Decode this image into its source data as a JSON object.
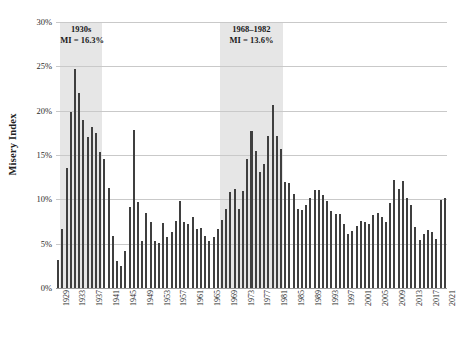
{
  "chart_data": {
    "type": "bar",
    "title": "",
    "xlabel": "",
    "ylabel": "Misery Index",
    "ylim": [
      0,
      30
    ],
    "grid": true,
    "legend": false,
    "y_ticks": [
      "0%",
      "5%",
      "10%",
      "15%",
      "20%",
      "25%",
      "30%"
    ],
    "y_tick_values": [
      0,
      5,
      10,
      15,
      20,
      25,
      30
    ],
    "x_tick_labels": [
      "1929",
      "1933",
      "1937",
      "1941",
      "1945",
      "1949",
      "1953",
      "1957",
      "1961",
      "1965",
      "1969",
      "1973",
      "1977",
      "1981",
      "1985",
      "1989",
      "1993",
      "1997",
      "2001",
      "2005",
      "2009",
      "2013",
      "2017",
      "2021"
    ],
    "categories": [
      1929,
      1930,
      1931,
      1932,
      1933,
      1934,
      1935,
      1936,
      1937,
      1938,
      1939,
      1940,
      1941,
      1942,
      1943,
      1944,
      1945,
      1946,
      1947,
      1948,
      1949,
      1950,
      1951,
      1952,
      1953,
      1954,
      1955,
      1956,
      1957,
      1958,
      1959,
      1960,
      1961,
      1962,
      1963,
      1964,
      1965,
      1966,
      1967,
      1968,
      1969,
      1970,
      1971,
      1972,
      1973,
      1974,
      1975,
      1976,
      1977,
      1978,
      1979,
      1980,
      1981,
      1982,
      1983,
      1984,
      1985,
      1986,
      1987,
      1988,
      1989,
      1990,
      1991,
      1992,
      1993,
      1994,
      1995,
      1996,
      1997,
      1998,
      1999,
      2000,
      2001,
      2002,
      2003,
      2004,
      2005,
      2006,
      2007,
      2008,
      2009,
      2010,
      2011,
      2012,
      2013,
      2014,
      2015,
      2016,
      2017,
      2018,
      2019,
      2020,
      2021
    ],
    "values": [
      3.2,
      6.7,
      13.5,
      19.9,
      24.7,
      22.0,
      19.0,
      17.0,
      18.2,
      17.5,
      15.3,
      14.5,
      11.3,
      5.9,
      3.0,
      2.5,
      4.2,
      9.1,
      17.8,
      9.7,
      5.3,
      8.5,
      7.4,
      5.3,
      5.1,
      7.3,
      5.8,
      6.3,
      7.6,
      9.8,
      7.5,
      7.2,
      8.0,
      6.7,
      6.8,
      5.9,
      5.3,
      5.7,
      6.6,
      7.7,
      8.9,
      10.8,
      11.2,
      8.9,
      10.9,
      14.5,
      17.7,
      15.4,
      13.1,
      14.0,
      17.1,
      20.6,
      17.2,
      15.7,
      12.0,
      11.8,
      10.6,
      8.9,
      8.8,
      9.4,
      10.1,
      11.0,
      11.0,
      10.5,
      9.8,
      8.7,
      8.4,
      8.3,
      7.2,
      6.1,
      6.4,
      7.0,
      7.6,
      7.4,
      7.2,
      8.2,
      8.5,
      8.0,
      7.5,
      9.6,
      12.2,
      11.2,
      12.1,
      10.2,
      9.4,
      6.9,
      5.4,
      6.1,
      6.5,
      6.3,
      5.5,
      9.9,
      10.1
    ],
    "bands": [
      {
        "label": "1930s",
        "detail": "MI = 16.3%",
        "start_year": 1930,
        "end_year": 1939,
        "color": "#e6e6e6"
      },
      {
        "label": "1968–1982",
        "detail": "MI = 13.6%",
        "start_year": 1968,
        "end_year": 1982,
        "color": "#e6e6e6"
      }
    ],
    "bar_color": "#3f3f3f"
  }
}
